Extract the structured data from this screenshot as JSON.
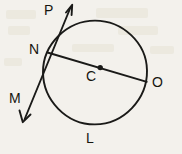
{
  "figure": {
    "kind": "geometry-diagram",
    "background_color": "#f3f1ec",
    "ink_color": "#1a1a18",
    "canvas": {
      "width": 182,
      "height": 154
    },
    "circle": {
      "cx": 95,
      "cy": 72.5,
      "r": 52,
      "label": "circle-C"
    },
    "centre_dot": {
      "cx": 100,
      "cy": 68,
      "r": 2.6
    },
    "chord": {
      "x1": 48,
      "y1": 53,
      "x2": 147,
      "y2": 82,
      "label": "diameter-NO"
    },
    "secant_line": {
      "x1": 72,
      "y1": 5,
      "x2": 23,
      "y2": 122,
      "label": "line-PM"
    },
    "arrowheads": [
      {
        "name": "arrowhead-p",
        "at_label": "P",
        "tip_x": 72,
        "tip_y": 5
      },
      {
        "name": "arrowhead-m",
        "at_label": "M",
        "tip_x": 23,
        "tip_y": 122
      }
    ],
    "labels": [
      {
        "id": "P",
        "text": "P",
        "x": 44,
        "y": 3,
        "name": "point-label-p"
      },
      {
        "id": "N",
        "text": "N",
        "x": 29,
        "y": 42,
        "name": "point-label-n"
      },
      {
        "id": "M",
        "text": "M",
        "x": 9,
        "y": 91,
        "name": "point-label-m"
      },
      {
        "id": "C",
        "text": "C",
        "x": 86,
        "y": 69,
        "name": "point-label-c"
      },
      {
        "id": "O",
        "text": "O",
        "x": 152,
        "y": 75,
        "name": "point-label-o"
      },
      {
        "id": "L",
        "text": "L",
        "x": 86,
        "y": 131,
        "name": "point-label-l"
      }
    ]
  }
}
